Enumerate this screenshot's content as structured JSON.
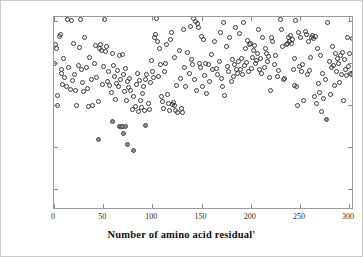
{
  "figure": {
    "background": "#ffffff",
    "axis_color": "#9a9a9a",
    "text_color": "#111111"
  },
  "chart_data": {
    "type": "scatter",
    "title": "",
    "xlabel": "Number of amino acid residual'",
    "ylabel": "lg(cond(W))",
    "xlim": [
      0,
      305
    ],
    "ylim": [
      18.25,
      20.55
    ],
    "xticks": [
      0,
      50,
      100,
      150,
      200,
      250,
      300
    ],
    "xticklabels": [
      "0",
      "50",
      "100",
      "150",
      "200",
      "250",
      "300"
    ],
    "yticks": [
      18.5,
      19,
      19.5,
      20,
      20.5
    ],
    "yticklabels": [
      "18.5",
      "19",
      "19.5",
      "20",
      "20.5"
    ],
    "grid": false,
    "legend": "none",
    "series": [
      {
        "name": "open-circles",
        "marker": "o",
        "fill": "none",
        "edge_color": "#3a3a3a",
        "points": [
          [
            1,
            19.99
          ],
          [
            2,
            20.22
          ],
          [
            3,
            20.17
          ],
          [
            4,
            19.62
          ],
          [
            4,
            19.49
          ],
          [
            6,
            20.32
          ],
          [
            7,
            20.34
          ],
          [
            8,
            19.92
          ],
          [
            8,
            19.88
          ],
          [
            9,
            19.75
          ],
          [
            10,
            20.05
          ],
          [
            11,
            19.83
          ],
          [
            13,
            19.72
          ],
          [
            14,
            20.52
          ],
          [
            15,
            19.95
          ],
          [
            17,
            19.69
          ],
          [
            18,
            20.51
          ],
          [
            19,
            19.79
          ],
          [
            20,
            20.24
          ],
          [
            21,
            19.86
          ],
          [
            22,
            19.68
          ],
          [
            23,
            19.49
          ],
          [
            25,
            19.97
          ],
          [
            26,
            20.19
          ],
          [
            27,
            20.52
          ],
          [
            28,
            19.93
          ],
          [
            29,
            19.77
          ],
          [
            30,
            19.66
          ],
          [
            31,
            20.31
          ],
          [
            33,
            19.95
          ],
          [
            34,
            19.7
          ],
          [
            35,
            19.48
          ],
          [
            36,
            20.07
          ],
          [
            38,
            19.81
          ],
          [
            39,
            19.49
          ],
          [
            41,
            19.99
          ],
          [
            42,
            20.21
          ],
          [
            43,
            19.83
          ],
          [
            45,
            19.54
          ],
          [
            46,
            20.18
          ],
          [
            47,
            20.22
          ],
          [
            48,
            20.15
          ],
          [
            49,
            19.74
          ],
          [
            50,
            19.96
          ],
          [
            51,
            20.52
          ],
          [
            52,
            20.14
          ],
          [
            53,
            20.2
          ],
          [
            54,
            19.78
          ],
          [
            55,
            19.9
          ],
          [
            56,
            19.73
          ],
          [
            58,
            19.65
          ],
          [
            59,
            20.11
          ],
          [
            60,
            19.97
          ],
          [
            61,
            19.84
          ],
          [
            63,
            19.57
          ],
          [
            64,
            19.76
          ],
          [
            65,
            19.91
          ],
          [
            66,
            19.72
          ],
          [
            67,
            20.09
          ],
          [
            68,
            19.81
          ],
          [
            70,
            20.1
          ],
          [
            71,
            19.87
          ],
          [
            72,
            19.66
          ],
          [
            73,
            19.94
          ],
          [
            74,
            19.56
          ],
          [
            75,
            19.78
          ],
          [
            76,
            19.71
          ],
          [
            77,
            19.82
          ],
          [
            78,
            19.68
          ],
          [
            80,
            19.45
          ],
          [
            81,
            19.6
          ],
          [
            83,
            19.48
          ],
          [
            84,
            19.75
          ],
          [
            85,
            19.88
          ],
          [
            86,
            19.42
          ],
          [
            87,
            19.79
          ],
          [
            88,
            19.55
          ],
          [
            89,
            19.47
          ],
          [
            90,
            19.64
          ],
          [
            91,
            19.72
          ],
          [
            92,
            19.44
          ],
          [
            93,
            19.81
          ],
          [
            94,
            19.86
          ],
          [
            96,
            19.52
          ],
          [
            97,
            19.45
          ],
          [
            98,
            19.77
          ],
          [
            99,
            20.03
          ],
          [
            100,
            19.9
          ],
          [
            101,
            19.83
          ],
          [
            102,
            20.3
          ],
          [
            103,
            20.34
          ],
          [
            104,
            20.53
          ],
          [
            105,
            20.26
          ],
          [
            106,
            19.84
          ],
          [
            107,
            20.18
          ],
          [
            108,
            19.98
          ],
          [
            109,
            19.6
          ],
          [
            110,
            19.54
          ],
          [
            111,
            19.46
          ],
          [
            112,
            19.9
          ],
          [
            113,
            19.99
          ],
          [
            114,
            20.22
          ],
          [
            115,
            19.63
          ],
          [
            116,
            19.52
          ],
          [
            117,
            19.44
          ],
          [
            118,
            20.28
          ],
          [
            119,
            20.36
          ],
          [
            120,
            19.51
          ],
          [
            121,
            19.53
          ],
          [
            122,
            19.49
          ],
          [
            123,
            20.07
          ],
          [
            124,
            19.43
          ],
          [
            125,
            19.73
          ],
          [
            126,
            19.41
          ],
          [
            128,
            20.15
          ],
          [
            129,
            19.82
          ],
          [
            130,
            19.46
          ],
          [
            131,
            19.41
          ],
          [
            132,
            20.4
          ],
          [
            133,
            19.95
          ],
          [
            134,
            19.72
          ],
          [
            136,
            20.13
          ],
          [
            138,
            19.88
          ],
          [
            139,
            20.44
          ],
          [
            140,
            20.04
          ],
          [
            141,
            19.98
          ],
          [
            142,
            20.53
          ],
          [
            143,
            19.8
          ],
          [
            144,
            20.5
          ],
          [
            145,
            19.68
          ],
          [
            146,
            20.47
          ],
          [
            147,
            20.42
          ],
          [
            148,
            19.99
          ],
          [
            149,
            19.95
          ],
          [
            150,
            20.32
          ],
          [
            151,
            19.72
          ],
          [
            152,
            20.28
          ],
          [
            153,
            19.85
          ],
          [
            154,
            20.0
          ],
          [
            155,
            19.64
          ],
          [
            157,
            19.98
          ],
          [
            158,
            19.78
          ],
          [
            160,
            20.1
          ],
          [
            161,
            19.92
          ],
          [
            163,
            20.26
          ],
          [
            165,
            19.94
          ],
          [
            166,
            19.86
          ],
          [
            168,
            20.02
          ],
          [
            169,
            20.36
          ],
          [
            170,
            19.82
          ],
          [
            171,
            19.72
          ],
          [
            172,
            20.48
          ],
          [
            173,
            19.61
          ],
          [
            175,
            20.2
          ],
          [
            176,
            19.96
          ],
          [
            177,
            19.9
          ],
          [
            178,
            20.3
          ],
          [
            180,
            19.78
          ],
          [
            181,
            20.04
          ],
          [
            182,
            19.84
          ],
          [
            184,
            19.98
          ],
          [
            185,
            20.42
          ],
          [
            186,
            19.93
          ],
          [
            187,
            19.88
          ],
          [
            188,
            20.02
          ],
          [
            189,
            20.35
          ],
          [
            190,
            19.92
          ],
          [
            191,
            20.05
          ],
          [
            192,
            19.86
          ],
          [
            193,
            20.49
          ],
          [
            194,
            19.97
          ],
          [
            195,
            20.18
          ],
          [
            196,
            20.01
          ],
          [
            197,
            20.27
          ],
          [
            198,
            19.9
          ],
          [
            199,
            20.22
          ],
          [
            200,
            20.23
          ],
          [
            201,
            19.94
          ],
          [
            202,
            20.07
          ],
          [
            203,
            20.15
          ],
          [
            204,
            20.21
          ],
          [
            205,
            19.99
          ],
          [
            206,
            20.03
          ],
          [
            207,
            20.12
          ],
          [
            208,
            20.4
          ],
          [
            209,
            19.92
          ],
          [
            210,
            20.06
          ],
          [
            211,
            19.88
          ],
          [
            212,
            20.3
          ],
          [
            214,
            19.95
          ],
          [
            215,
            20.17
          ],
          [
            216,
            20.11
          ],
          [
            217,
            20.02
          ],
          [
            218,
            20.08
          ],
          [
            219,
            19.83
          ],
          [
            220,
            19.68
          ],
          [
            221,
            20.31
          ],
          [
            222,
            20.26
          ],
          [
            224,
            19.98
          ],
          [
            225,
            20.09
          ],
          [
            227,
            19.84
          ],
          [
            228,
            19.91
          ],
          [
            230,
            20.52
          ],
          [
            231,
            20.4
          ],
          [
            232,
            20.2
          ],
          [
            233,
            19.8
          ],
          [
            234,
            19.82
          ],
          [
            236,
            20.22
          ],
          [
            237,
            20.24
          ],
          [
            238,
            20.3
          ],
          [
            239,
            20.26
          ],
          [
            240,
            20.33
          ],
          [
            241,
            20.23
          ],
          [
            242,
            20.28
          ],
          [
            243,
            19.93
          ],
          [
            244,
            19.73
          ],
          [
            245,
            20.05
          ],
          [
            246,
            20.51
          ],
          [
            247,
            19.72
          ],
          [
            248,
            19.5
          ],
          [
            249,
            20.37
          ],
          [
            250,
            19.96
          ],
          [
            251,
            20.3
          ],
          [
            252,
            19.9
          ],
          [
            253,
            19.98
          ],
          [
            254,
            19.55
          ],
          [
            256,
            20.38
          ],
          [
            257,
            20.34
          ],
          [
            258,
            19.86
          ],
          [
            259,
            20.26
          ],
          [
            260,
            19.91
          ],
          [
            261,
            20.07
          ],
          [
            262,
            20.3
          ],
          [
            263,
            20.33
          ],
          [
            264,
            20.29
          ],
          [
            265,
            19.6
          ],
          [
            266,
            20.32
          ],
          [
            267,
            19.52
          ],
          [
            268,
            20.18
          ],
          [
            269,
            19.76
          ],
          [
            270,
            19.65
          ],
          [
            271,
            20.09
          ],
          [
            272,
            19.42
          ],
          [
            273,
            19.88
          ],
          [
            274,
            19.58
          ],
          [
            276,
            19.81
          ],
          [
            278,
            20.48
          ],
          [
            280,
            20.02
          ],
          [
            281,
            19.63
          ],
          [
            282,
            19.95
          ],
          [
            283,
            20.2
          ],
          [
            284,
            19.97
          ],
          [
            285,
            19.73
          ],
          [
            286,
            20.12
          ],
          [
            287,
            19.9
          ],
          [
            288,
            20.06
          ],
          [
            289,
            20.0
          ],
          [
            290,
            19.77
          ],
          [
            291,
            20.09
          ],
          [
            292,
            19.86
          ],
          [
            293,
            20.13
          ],
          [
            294,
            19.56
          ],
          [
            295,
            20.04
          ],
          [
            296,
            19.92
          ],
          [
            297,
            19.85
          ],
          [
            298,
            20.3
          ],
          [
            299,
            19.96
          ],
          [
            300,
            20.11
          ],
          [
            301,
            19.88
          ],
          [
            302,
            19.87
          ],
          [
            303,
            20.29
          ],
          [
            304,
            19.89
          ]
        ]
      },
      {
        "name": "filled-circles",
        "marker": "o",
        "fill": "#8e8e8e",
        "edge_color": "#4a4a4a",
        "points": [
          [
            45,
            19.09
          ],
          [
            59,
            19.3
          ],
          [
            67,
            19.25
          ],
          [
            69,
            19.24
          ],
          [
            70,
            19.25
          ],
          [
            71,
            19.16
          ],
          [
            73,
            19.25
          ],
          [
            75,
            19.03
          ],
          [
            81,
            18.96
          ],
          [
            93,
            19.26
          ],
          [
            277,
            19.33
          ]
        ]
      }
    ]
  }
}
